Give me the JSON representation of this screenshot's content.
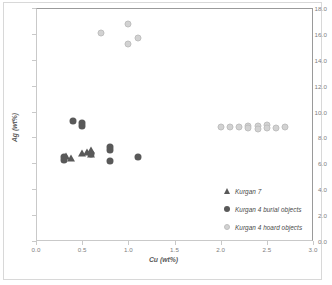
{
  "chart_data": {
    "type": "scatter",
    "title": "",
    "xlabel": "Cu (wt%)",
    "ylabel": "Ag (wt%)",
    "xlim": [
      0.0,
      3.0
    ],
    "ylim": [
      0.0,
      18.0
    ],
    "xticks": [
      "0.0",
      "0.5",
      "1.0",
      "1.5",
      "2.0",
      "2.5",
      "3.0"
    ],
    "xtick_values": [
      0.0,
      0.5,
      1.0,
      1.5,
      2.0,
      2.5,
      3.0
    ],
    "yticks": [
      "0.0",
      "2.0",
      "4.0",
      "6.0",
      "8.0",
      "10.0",
      "12.0",
      "14.0",
      "16.0",
      "18.0"
    ],
    "ytick_values": [
      0.0,
      2.0,
      4.0,
      6.0,
      8.0,
      10.0,
      12.0,
      14.0,
      16.0,
      18.0
    ],
    "grid": false,
    "legend_position": "lower-right",
    "series": [
      {
        "name": "Kurgan 7",
        "marker": "triangle",
        "color": "#595959",
        "points": [
          {
            "x": 0.32,
            "y": 6.6
          },
          {
            "x": 0.38,
            "y": 6.4
          },
          {
            "x": 0.5,
            "y": 6.8
          },
          {
            "x": 0.55,
            "y": 6.9
          },
          {
            "x": 0.6,
            "y": 7.05
          },
          {
            "x": 0.6,
            "y": 6.7
          }
        ]
      },
      {
        "name": "Kurgan 4 burial objects",
        "marker": "filled-circle",
        "color": "#595959",
        "points": [
          {
            "x": 0.3,
            "y": 6.5
          },
          {
            "x": 0.3,
            "y": 6.25
          },
          {
            "x": 0.4,
            "y": 9.3
          },
          {
            "x": 0.5,
            "y": 9.1
          },
          {
            "x": 0.5,
            "y": 8.9
          },
          {
            "x": 0.6,
            "y": 6.75
          },
          {
            "x": 0.8,
            "y": 7.3
          },
          {
            "x": 0.8,
            "y": 7.05
          },
          {
            "x": 0.8,
            "y": 6.2
          },
          {
            "x": 1.1,
            "y": 6.5
          }
        ]
      },
      {
        "name": "Kurgan 4 hoard objects",
        "marker": "open-circle",
        "color": "#d2d2d2",
        "points": [
          {
            "x": 0.7,
            "y": 16.1
          },
          {
            "x": 1.0,
            "y": 16.8
          },
          {
            "x": 1.0,
            "y": 15.2
          },
          {
            "x": 1.1,
            "y": 15.7
          },
          {
            "x": 2.0,
            "y": 8.8
          },
          {
            "x": 2.1,
            "y": 8.8
          },
          {
            "x": 2.2,
            "y": 8.8
          },
          {
            "x": 2.3,
            "y": 8.9
          },
          {
            "x": 2.3,
            "y": 8.7
          },
          {
            "x": 2.4,
            "y": 8.9
          },
          {
            "x": 2.4,
            "y": 8.65
          },
          {
            "x": 2.5,
            "y": 8.95
          },
          {
            "x": 2.5,
            "y": 8.7
          },
          {
            "x": 2.6,
            "y": 8.7
          },
          {
            "x": 2.7,
            "y": 8.8
          }
        ]
      }
    ]
  }
}
